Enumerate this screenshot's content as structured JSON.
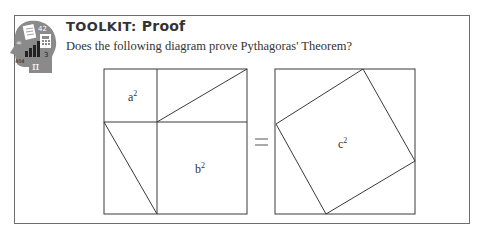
{
  "header": {
    "keyword": "TOOLKIT:",
    "title": "Proof"
  },
  "question": "Does the following diagram prove Pythagoras' Theorem?",
  "icon": {
    "name": "toolkit-head-icon",
    "glyphs": [
      "42",
      "∞",
      "3",
      "404",
      "π"
    ],
    "color": "#8a8a8a"
  },
  "diagram": {
    "left_square": {
      "labels": [
        {
          "base": "a",
          "exp": "2"
        },
        {
          "base": "b",
          "exp": "2"
        }
      ]
    },
    "operator": "=",
    "right_square": {
      "labels": [
        {
          "base": "c",
          "exp": "2"
        }
      ]
    }
  },
  "colors": {
    "line": "#3a3a3a",
    "frame": "#6d6d6d",
    "text": "#333333"
  }
}
